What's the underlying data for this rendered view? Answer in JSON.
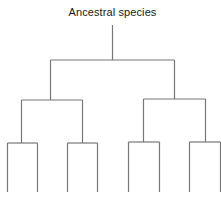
{
  "diagram": {
    "type": "phylogenetic-tree",
    "root_label": "Ancestral species",
    "line_color": "#777777",
    "levels": 3,
    "leaf_count": 8,
    "leaf_labels": []
  }
}
